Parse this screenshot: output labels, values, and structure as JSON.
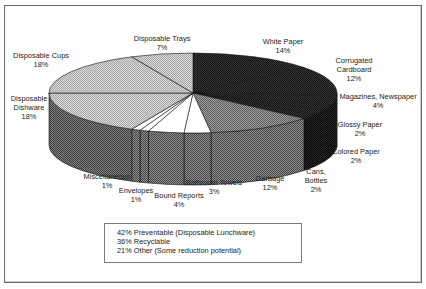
{
  "chart_data": {
    "type": "pie",
    "title": "",
    "style": "3d-exploded-none",
    "slices": [
      {
        "label": "White Paper",
        "value": 14,
        "group": "Recyclable"
      },
      {
        "label": "Corrugated Cardboard",
        "value": 12,
        "group": "Recyclable"
      },
      {
        "label": "Magazines, Newspaper",
        "value": 4,
        "group": "Recyclable"
      },
      {
        "label": "Glossy Paper",
        "value": 2,
        "group": "Recyclable"
      },
      {
        "label": "Colored Paper",
        "value": 2,
        "group": "Recyclable"
      },
      {
        "label": "Cans, Bottles",
        "value": 2,
        "group": "Recyclable"
      },
      {
        "label": "Garbage",
        "value": 12,
        "group": "Other"
      },
      {
        "label": "Bathroom Towels",
        "value": 3,
        "group": "Other"
      },
      {
        "label": "Bound Reports",
        "value": 4,
        "group": "Other"
      },
      {
        "label": "Envelopes",
        "value": 1,
        "group": "Other"
      },
      {
        "label": "Miscellaneous",
        "value": 1,
        "group": "Other"
      },
      {
        "label": "Disposable Dishware",
        "value": 18,
        "group": "Preventable"
      },
      {
        "label": "Disposable Cups",
        "value": 18,
        "group": "Preventable"
      },
      {
        "label": "Disposable Trays",
        "value": 7,
        "group": "Preventable"
      }
    ],
    "summary": [
      "42% Preventable (Disposable Lunchware)",
      "36% Recyclable",
      "21% Other (Some reduction potential)"
    ]
  },
  "labels": {
    "white_paper": {
      "name": "White Paper",
      "pct": "14%"
    },
    "corrugated": {
      "name1": "Corrugated",
      "name2": "Cardboard",
      "pct": "12%"
    },
    "magazines": {
      "name": "Magazines, Newspaper",
      "pct": "4%"
    },
    "glossy": {
      "name": "Glossy Paper",
      "pct": "2%"
    },
    "colored": {
      "name": "Colored Paper",
      "pct": "2%"
    },
    "cans": {
      "name1": "Cans,",
      "name2": "Bottles",
      "pct": "2%"
    },
    "garbage": {
      "name": "Garbage",
      "pct": "12%"
    },
    "bathroom": {
      "name": "Bathroom Towels",
      "pct": "3%"
    },
    "bound": {
      "name": "Bound Reports",
      "pct": "4%"
    },
    "envelopes": {
      "name": "Envelopes",
      "pct": "1%"
    },
    "misc": {
      "name": "Miscellaneous",
      "pct": "1%"
    },
    "dishware": {
      "name1": "Disposable",
      "name2": "Dishware",
      "pct": "18%"
    },
    "cups": {
      "name": "Disposable Cups",
      "pct": "18%"
    },
    "trays": {
      "name": "Disposable Trays",
      "pct": "7%"
    }
  },
  "legend": {
    "line1": "42% Preventable (Disposable Lunchware)",
    "line2": "36% Recyclable",
    "line3": "21% Other (Some reduction potential)"
  },
  "colors": {
    "recyclable_top": "#2a2a2a",
    "recyclable_side": "#1e1e1e",
    "other_top": "#ffffff",
    "other_garbage_top": "#8a8a8a",
    "other_side": "#7d7d7d",
    "preventable_top": "#c4c4c4",
    "preventable_side": "#6a6a6a",
    "outline": "#111111"
  }
}
